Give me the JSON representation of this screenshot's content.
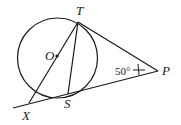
{
  "diagram": {
    "labels": {
      "T": "T",
      "O": "O",
      "P": "P",
      "X": "X",
      "S": "S"
    },
    "angle_label": "50°",
    "colors": {
      "stroke": "#1a1a1a",
      "background": "#ffffff"
    }
  }
}
